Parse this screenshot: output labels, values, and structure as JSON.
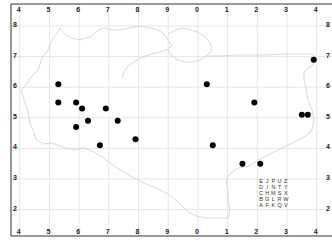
{
  "chart_data": {
    "type": "scatter",
    "title": "",
    "xlabel": "",
    "ylabel": "",
    "grid": true,
    "x_tick_labels": [
      "4",
      "5",
      "6",
      "7",
      "8",
      "9",
      "0",
      "1",
      "2",
      "3",
      "4"
    ],
    "y_tick_labels": [
      "8",
      "7",
      "6",
      "5",
      "4",
      "3",
      "2"
    ],
    "points": [
      {
        "x": 5.3,
        "y": 6.1
      },
      {
        "x": 5.3,
        "y": 5.5
      },
      {
        "x": 5.9,
        "y": 5.5
      },
      {
        "x": 6.1,
        "y": 5.3
      },
      {
        "x": 6.9,
        "y": 5.3
      },
      {
        "x": 6.3,
        "y": 4.9
      },
      {
        "x": 7.3,
        "y": 4.9
      },
      {
        "x": 5.9,
        "y": 4.7
      },
      {
        "x": 6.7,
        "y": 4.1
      },
      {
        "x": 7.9,
        "y": 4.3
      },
      {
        "x": 10.3,
        "y": 6.1
      },
      {
        "x": 11.9,
        "y": 5.5
      },
      {
        "x": 10.5,
        "y": 4.1
      },
      {
        "x": 11.5,
        "y": 3.5
      },
      {
        "x": 12.1,
        "y": 3.5
      },
      {
        "x": 13.5,
        "y": 5.1
      },
      {
        "x": 13.7,
        "y": 5.1
      },
      {
        "x": 13.9,
        "y": 6.9
      }
    ]
  },
  "key": {
    "rows": [
      [
        "E",
        "J",
        "P",
        "U",
        "Z"
      ],
      [
        "D",
        "I",
        "N",
        "T",
        "Y"
      ],
      [
        "C",
        "H",
        "M",
        "S",
        "X"
      ],
      [
        "B",
        "G",
        "L",
        "R",
        "W"
      ],
      [
        "A",
        "F",
        "K",
        "Q",
        "V"
      ]
    ]
  },
  "colors": {
    "dot": "#000000",
    "grid": "#e6e6e6",
    "outline": "#cfcfcf",
    "frame": "#333333"
  }
}
